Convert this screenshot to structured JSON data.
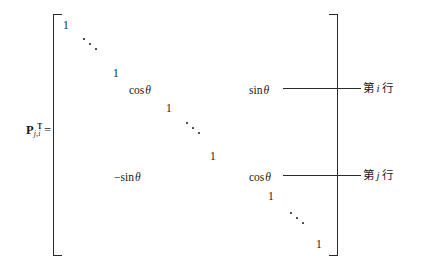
{
  "figure": {
    "type": "matrix-equation"
  },
  "label": {
    "symbol": "P",
    "subscript": "j,i",
    "superscript": "T",
    "equals": "="
  },
  "matrix": {
    "entries": [
      {
        "id": "e1",
        "text": "1",
        "x": 63,
        "y": 20
      },
      {
        "id": "e2",
        "text": "1",
        "x": 113,
        "y": 68
      },
      {
        "id": "e3",
        "text": "cos",
        "theta": "θ",
        "x": 129,
        "y": 85
      },
      {
        "id": "e4",
        "text": "sin",
        "theta": "θ",
        "x": 249,
        "y": 85
      },
      {
        "id": "e5",
        "text": "1",
        "x": 166,
        "y": 103
      },
      {
        "id": "e6",
        "text": "1",
        "x": 210,
        "y": 151
      },
      {
        "id": "e7",
        "text": "−sin",
        "theta": "θ",
        "x": 114,
        "y": 172
      },
      {
        "id": "e8",
        "text": "cos",
        "theta": "θ",
        "x": 249,
        "y": 172
      },
      {
        "id": "e9",
        "text": "1",
        "x": 268,
        "y": 191
      },
      {
        "id": "e10",
        "text": "1",
        "x": 316,
        "y": 239
      }
    ],
    "ellipses": [
      {
        "id": "d1",
        "x": 82,
        "y": 36
      },
      {
        "id": "d2",
        "x": 185,
        "y": 120
      },
      {
        "id": "d3",
        "x": 289,
        "y": 210
      }
    ]
  },
  "annotations": [
    {
      "id": "row-i",
      "prefix": "第",
      "index": "i",
      "suffix": "行",
      "leader": {
        "x": 283,
        "y": 88,
        "width": 78
      },
      "text_x": 363,
      "text_y": 83
    },
    {
      "id": "row-j",
      "prefix": "第",
      "index": "j",
      "suffix": "行",
      "leader": {
        "x": 283,
        "y": 175,
        "width": 78
      },
      "text_x": 363,
      "text_y": 170
    }
  ],
  "colors": {
    "ink": "#1a1a1a",
    "rule": "#2a2a2a",
    "background": "#ffffff"
  }
}
